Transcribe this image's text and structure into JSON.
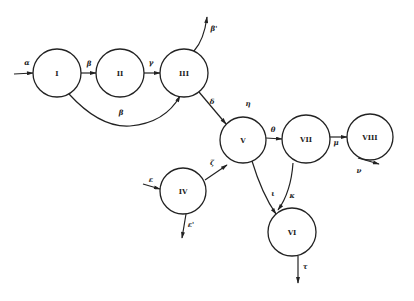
{
  "diagram": {
    "type": "flow-graph",
    "nodes": [
      {
        "id": "I",
        "label": "I",
        "cx": 57,
        "cy": 73,
        "r": 24
      },
      {
        "id": "II",
        "label": "II",
        "cx": 120,
        "cy": 73,
        "r": 24
      },
      {
        "id": "III",
        "label": "III",
        "cx": 184,
        "cy": 73,
        "r": 24
      },
      {
        "id": "IV",
        "label": "IV",
        "cx": 183,
        "cy": 191,
        "r": 23
      },
      {
        "id": "V",
        "label": "V",
        "cx": 243,
        "cy": 140,
        "r": 23
      },
      {
        "id": "VI",
        "label": "VI",
        "cx": 292,
        "cy": 232,
        "r": 24
      },
      {
        "id": "VII",
        "label": "VII",
        "cx": 306,
        "cy": 139,
        "r": 24
      },
      {
        "id": "VIII",
        "label": "VIII",
        "cx": 370,
        "cy": 137,
        "r": 23
      }
    ],
    "edges": [
      {
        "from": "input",
        "to": "I",
        "label": "α"
      },
      {
        "from": "I",
        "to": "II",
        "label": "β"
      },
      {
        "from": "II",
        "to": "III",
        "label": "γ"
      },
      {
        "from": "I",
        "to": "III",
        "label": "β",
        "curved": true
      },
      {
        "from": "III",
        "to": "output",
        "label": "β'"
      },
      {
        "from": "III",
        "to": "V",
        "label": "δ"
      },
      {
        "from": "input",
        "to": "IV",
        "label": "ε"
      },
      {
        "from": "IV",
        "to": "output",
        "label": "ε'"
      },
      {
        "from": "IV",
        "to": "V",
        "label": "ζ"
      },
      {
        "from": "V",
        "to": "VII",
        "label": "θ"
      },
      {
        "from": "V",
        "to": "VI",
        "label": "ι"
      },
      {
        "from": "VII",
        "to": "VIII",
        "label": "μ"
      },
      {
        "from": "VII",
        "to": "VI",
        "label": "κ"
      },
      {
        "from": "VIII",
        "to": "output",
        "label": "ν"
      },
      {
        "from": "VI",
        "to": "output",
        "label": "τ"
      }
    ],
    "annotations": [
      {
        "label": "η",
        "near": "V"
      }
    ]
  },
  "labels": {
    "nodes": {
      "I": "I",
      "II": "II",
      "III": "III",
      "IV": "IV",
      "V": "V",
      "VI": "VI",
      "VII": "VII",
      "VIII": "VIII"
    },
    "edges": {
      "alpha": "α",
      "beta": "β",
      "gamma": "γ",
      "beta_curve": "β",
      "beta_prime": "β'",
      "delta": "δ",
      "eta": "η",
      "epsilon": "ε",
      "epsilon_prime": "ε'",
      "zeta": "ζ",
      "theta": "θ",
      "iota": "ι",
      "kappa": "κ",
      "mu": "μ",
      "nu": "ν",
      "tau": "τ"
    }
  }
}
